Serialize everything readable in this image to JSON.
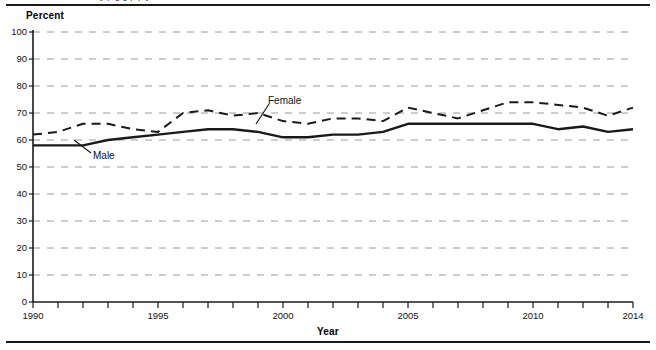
{
  "figure": {
    "clipped_caption_fragment": "y p g g p p y",
    "y_axis_title": "Percent",
    "x_axis_title": "Year",
    "series_labels": {
      "male": "Male",
      "female": "Female"
    }
  },
  "chart_data": {
    "type": "line",
    "title": "",
    "xlabel": "Year",
    "ylabel": "Percent",
    "xlim": [
      1990,
      2014
    ],
    "ylim": [
      0,
      100
    ],
    "grid": true,
    "grid_style": "dashed-horizontal",
    "legend_position": "inline-annotation",
    "x": [
      1990,
      1991,
      1992,
      1993,
      1994,
      1995,
      1996,
      1997,
      1998,
      1999,
      2000,
      2001,
      2002,
      2003,
      2004,
      2005,
      2006,
      2007,
      2008,
      2009,
      2010,
      2011,
      2012,
      2013,
      2014
    ],
    "xticks": [
      1990,
      1995,
      2000,
      2005,
      2010,
      2014
    ],
    "xticklabels": [
      "1990",
      "1995",
      "2000",
      "2005",
      "2010",
      "2014"
    ],
    "yticks": [
      0,
      10,
      20,
      30,
      40,
      50,
      60,
      70,
      80,
      90,
      100
    ],
    "yticklabels": [
      "0",
      "10",
      "20",
      "30",
      "40",
      "50",
      "60",
      "70",
      "80",
      "90",
      "100"
    ],
    "series": [
      {
        "name": "Male",
        "style": "solid",
        "color": "#1a1a1a",
        "values": [
          58,
          58,
          58,
          60,
          61,
          62,
          63,
          64,
          64,
          63,
          61,
          61,
          62,
          62,
          63,
          66,
          66,
          66,
          66,
          66,
          66,
          64,
          65,
          63,
          64
        ]
      },
      {
        "name": "Female",
        "style": "dashed",
        "color": "#1a1a1a",
        "values": [
          62,
          63,
          66,
          66,
          64,
          63,
          70,
          71,
          69,
          70,
          67,
          66,
          68,
          68,
          67,
          72,
          70,
          68,
          71,
          74,
          74,
          73,
          72,
          69,
          72
        ]
      }
    ]
  }
}
